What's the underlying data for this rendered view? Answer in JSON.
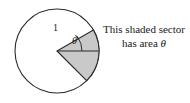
{
  "figure": {
    "circle": {
      "cx": 57,
      "cy": 51,
      "r": 42,
      "stroke": "#2b2b2b",
      "fill": "#ffffff"
    },
    "sector": {
      "fill": "#c9c9c9",
      "stroke": "#2b2b2b",
      "start_angle_deg": -30,
      "end_angle_deg": 45,
      "center_label": "sector-apex"
    },
    "radius_label": "1",
    "angle_label": "θ",
    "caption": {
      "line1": "This shaded sector",
      "line2_prefix": "has  area ",
      "line2_symbol": "θ"
    }
  }
}
